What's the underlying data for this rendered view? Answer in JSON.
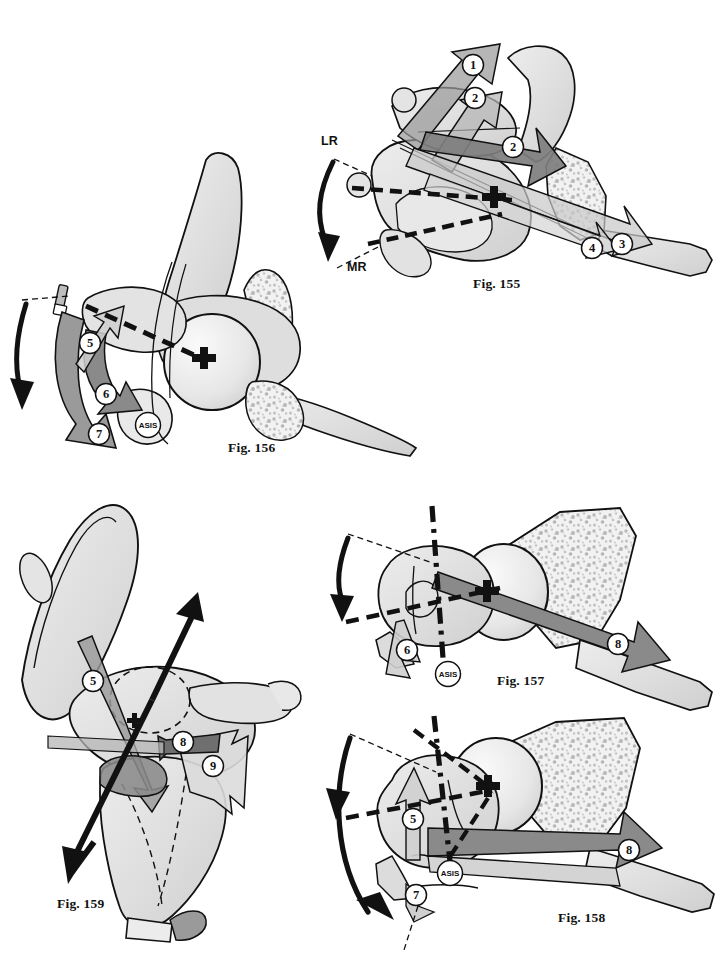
{
  "plate": {
    "title": "Hip joint osteotomy and rotation figure plate",
    "background_color": "#ffffff",
    "width": 727,
    "height": 964
  },
  "palette": {
    "outline": "#111111",
    "bone_light": "#e3e3e3",
    "bone_mid": "#d2d2d2",
    "bone_shadow": "#bdbdbd",
    "arrow_gray": "#8a8a8a",
    "arrow_dark_gray": "#6f6f6f",
    "arrow_light_gray": "#c9c9c9",
    "arrow_black": "#111111",
    "trabecular_speckle": "#b9b9b9",
    "marker_fill": "#ffffff",
    "page_background": "#ffffff"
  },
  "figures": [
    {
      "id": "fig155",
      "caption": "Fig. 155",
      "view": "superior-oblique pelvis with femur",
      "caption_x": 473,
      "caption_y": 283,
      "axis_labels": [
        {
          "text": "LR",
          "x": 327,
          "y": 141,
          "meaning": "lateral rotation"
        },
        {
          "text": "MR",
          "x": 352,
          "y": 267,
          "meaning": "medial rotation"
        }
      ],
      "markers": [
        {
          "label": "1",
          "x": 473,
          "y": 65
        },
        {
          "label": "2",
          "x": 475,
          "y": 98
        },
        {
          "label": "2",
          "x": 513,
          "y": 147
        },
        {
          "label": "3",
          "x": 622,
          "y": 244
        },
        {
          "label": "4",
          "x": 592,
          "y": 248
        }
      ],
      "center_cross": {
        "x": 498,
        "y": 202
      },
      "has_rotation_arc": true,
      "dashed_axes": 2
    },
    {
      "id": "fig156",
      "caption": "Fig. 156",
      "view": "lateral pelvis with femoral head",
      "caption_x": 228,
      "caption_y": 447,
      "axis_labels": [],
      "markers": [
        {
          "label": "5",
          "x": 90,
          "y": 343
        },
        {
          "label": "6",
          "x": 106,
          "y": 394
        },
        {
          "label": "7",
          "x": 99,
          "y": 434
        }
      ],
      "landmarks": [
        {
          "label": "ASIS",
          "x": 148,
          "y": 425
        }
      ],
      "center_cross": {
        "x": 207,
        "y": 362
      },
      "has_rotation_arc": true,
      "dashed_axes": 1
    },
    {
      "id": "fig157",
      "caption": "Fig. 157",
      "view": "anterior pelvis with femur, retroversion",
      "caption_x": 497,
      "caption_y": 680,
      "axis_labels": [],
      "markers": [
        {
          "label": "6",
          "x": 407,
          "y": 650
        },
        {
          "label": "8",
          "x": 618,
          "y": 644
        }
      ],
      "landmarks": [
        {
          "label": "ASIS",
          "x": 448,
          "y": 674
        }
      ],
      "center_cross": {
        "x": 487,
        "y": 595
      },
      "has_rotation_arc": true,
      "dashed_axes": 2
    },
    {
      "id": "fig158",
      "caption": "Fig. 158",
      "view": "anterior pelvis with femur, anteversion",
      "caption_x": 558,
      "caption_y": 917,
      "axis_labels": [],
      "markers": [
        {
          "label": "5",
          "x": 413,
          "y": 819
        },
        {
          "label": "7",
          "x": 416,
          "y": 895
        },
        {
          "label": "8",
          "x": 629,
          "y": 850
        }
      ],
      "landmarks": [
        {
          "label": "ASIS",
          "x": 450,
          "y": 873
        }
      ],
      "center_cross": {
        "x": 488,
        "y": 790
      },
      "has_rotation_arc": true,
      "dashed_axes": 2
    },
    {
      "id": "fig159",
      "caption": "Fig. 159",
      "view": "oblique hemipelvis, three-dimensional",
      "caption_x": 57,
      "caption_y": 903,
      "axis_labels": [],
      "markers": [
        {
          "label": "5",
          "x": 93,
          "y": 681
        },
        {
          "label": "8",
          "x": 183,
          "y": 742
        },
        {
          "label": "9",
          "x": 213,
          "y": 766
        }
      ],
      "landmarks": [],
      "center_cross": {
        "x": 135,
        "y": 723
      },
      "has_rotation_arc": false,
      "double_headed_arrow": true
    }
  ],
  "legend_numbers": [
    "1",
    "2",
    "3",
    "4",
    "5",
    "6",
    "7",
    "8",
    "9"
  ],
  "icons": {
    "rotation_arc": "curved-arrow-icon",
    "center_marker": "plus-cross-icon",
    "landmark_marker": "asis-landmark-icon",
    "number_marker": "numbered-circle-icon",
    "block_arrow": "block-arrow-icon",
    "axis_line": "dashed-axis-icon"
  }
}
